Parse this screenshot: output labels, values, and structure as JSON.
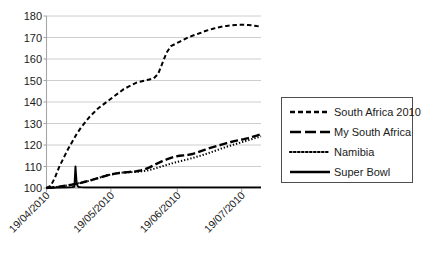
{
  "chart_data": {
    "type": "line",
    "title": "",
    "xlabel": "",
    "ylabel": "",
    "ylim": [
      100,
      180
    ],
    "ytick_values": [
      100,
      110,
      120,
      130,
      140,
      150,
      160,
      170,
      180
    ],
    "ytick_labels": [
      "100",
      "110",
      "120",
      "130",
      "140",
      "150",
      "160",
      "170",
      "180"
    ],
    "grid": true,
    "grid_axis": "y",
    "legend_position": "right-outside",
    "x_axis_type": "date",
    "x_tick_labels": [
      "19/04/2010",
      "19/05/2010",
      "19/06/2010",
      "19/07/2010"
    ],
    "x_tick_positions_days": [
      0,
      30,
      61,
      91
    ],
    "x_range_days": [
      0,
      100
    ],
    "series": [
      {
        "name": "South Africa 2010",
        "style": "dashed",
        "color": "#000000",
        "x": [
          0,
          2,
          4,
          6,
          8,
          10,
          12,
          14,
          16,
          18,
          20,
          22,
          24,
          26,
          28,
          30,
          32,
          34,
          36,
          38,
          40,
          42,
          44,
          46,
          48,
          50,
          52,
          54,
          56,
          58,
          60,
          62,
          64,
          66,
          68,
          70,
          72,
          74,
          76,
          78,
          80,
          82,
          84,
          86,
          88,
          90,
          92,
          94,
          96,
          98,
          100
        ],
        "values": [
          100,
          101,
          105,
          110,
          114,
          118,
          121.5,
          125,
          128,
          130.5,
          133,
          135,
          137,
          138.5,
          140,
          141.5,
          143,
          144.5,
          146,
          147,
          148,
          149,
          149.5,
          150,
          150.5,
          151,
          153,
          158,
          163,
          166,
          167,
          168,
          169,
          170,
          170.8,
          171.5,
          172.2,
          173,
          173.6,
          174.2,
          174.7,
          175.1,
          175.4,
          175.6,
          175.8,
          175.9,
          175.9,
          175.8,
          175.6,
          175.3,
          175.1
        ]
      },
      {
        "name": "My South Africa",
        "style": "long-dash",
        "color": "#000000",
        "x": [
          0,
          2,
          4,
          6,
          8,
          10,
          12,
          14,
          16,
          18,
          20,
          22,
          24,
          26,
          28,
          30,
          32,
          34,
          36,
          38,
          40,
          42,
          44,
          46,
          48,
          50,
          52,
          54,
          56,
          58,
          60,
          62,
          64,
          66,
          68,
          70,
          72,
          74,
          76,
          78,
          80,
          82,
          84,
          86,
          88,
          90,
          92,
          94,
          96,
          98,
          100
        ],
        "values": [
          100,
          100.2,
          100.4,
          100.6,
          100.9,
          101.2,
          101.6,
          102,
          102.4,
          102.9,
          103.4,
          104,
          104.6,
          105.2,
          105.8,
          106.3,
          106.7,
          107,
          107.2,
          107.4,
          107.6,
          107.8,
          108.2,
          108.8,
          109.6,
          110.6,
          111.6,
          112.5,
          113.3,
          114,
          114.6,
          115,
          115.2,
          115.4,
          115.8,
          116.4,
          117.1,
          117.8,
          118.5,
          119.1,
          119.7,
          120.3,
          120.9,
          121.4,
          121.9,
          122.3,
          122.7,
          123.2,
          123.8,
          124.4,
          125
        ]
      },
      {
        "name": "Namibia",
        "style": "dotted",
        "color": "#000000",
        "x": [
          0,
          2,
          4,
          6,
          8,
          10,
          12,
          14,
          16,
          18,
          20,
          22,
          24,
          26,
          28,
          30,
          32,
          34,
          36,
          38,
          40,
          42,
          44,
          46,
          48,
          50,
          52,
          54,
          56,
          58,
          60,
          62,
          64,
          66,
          68,
          70,
          72,
          74,
          76,
          78,
          80,
          82,
          84,
          86,
          88,
          90,
          92,
          94,
          96,
          98,
          100
        ],
        "values": [
          100,
          100.2,
          100.4,
          100.6,
          100.9,
          101.2,
          101.6,
          102,
          102.4,
          102.9,
          103.4,
          104,
          104.6,
          105.2,
          105.8,
          106.3,
          106.7,
          107,
          107.2,
          107.3,
          107.4,
          107.5,
          107.7,
          108,
          108.4,
          108.9,
          109.5,
          110.1,
          110.7,
          111.3,
          111.9,
          112.4,
          112.9,
          113.4,
          113.9,
          114.5,
          115.1,
          115.7,
          116.4,
          117.1,
          117.8,
          118.5,
          119.2,
          119.8,
          120.4,
          121,
          121.6,
          122.2,
          122.8,
          123.4,
          124
        ]
      },
      {
        "name": "Super Bowl",
        "style": "solid",
        "color": "#000000",
        "x": [
          0,
          5,
          10,
          12,
          13,
          13.5,
          14,
          14.5,
          15,
          16,
          18,
          20,
          25,
          30,
          40,
          50,
          60,
          70,
          80,
          90,
          100
        ],
        "values": [
          100,
          100.2,
          100.3,
          100.4,
          100.6,
          110,
          103,
          100.8,
          100.5,
          100.4,
          100.3,
          100.3,
          100.3,
          100.3,
          100.3,
          100.3,
          100.3,
          100.3,
          100.3,
          100.3,
          100.3
        ]
      }
    ]
  },
  "legend": {
    "items": [
      {
        "label": "South Africa 2010",
        "style": "dashed"
      },
      {
        "label": "My South Africa",
        "style": "long-dash"
      },
      {
        "label": "Namibia",
        "style": "dotted"
      },
      {
        "label": "Super Bowl",
        "style": "solid"
      }
    ]
  },
  "colors": {
    "series": "#000000",
    "gridline": "#c8c8c8",
    "axis": "#a6a6a6",
    "legend_border": "#4d4d4d",
    "background": "#ffffff",
    "text": "#1a1a1a"
  }
}
